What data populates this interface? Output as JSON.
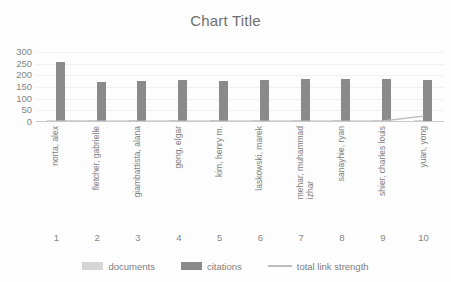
{
  "chart_data": {
    "type": "bar",
    "title": "Chart Title",
    "xlabel": "",
    "ylabel": "",
    "ylim": [
      0,
      300
    ],
    "yticks": [
      300,
      250,
      200,
      150,
      100,
      50,
      0
    ],
    "grid": true,
    "legend_position": "bottom",
    "categories": [
      "norta, alex",
      "fletcher, gabrielle",
      "giambattista, alana",
      "gong, elgar",
      "kim, henry m.",
      "laskowski, marek",
      "mehar, muhammad\nizhar",
      "sanayhie, ryan",
      "shier, charles louis",
      "yuan, yong"
    ],
    "index_labels": [
      "1",
      "2",
      "3",
      "4",
      "5",
      "6",
      "7",
      "8",
      "9",
      "10"
    ],
    "series": [
      {
        "name": "documents",
        "type": "bar",
        "color": "#d5d5d5",
        "values": [
          3,
          2,
          2,
          2,
          2,
          2,
          2,
          2,
          2,
          3
        ]
      },
      {
        "name": "citations",
        "type": "bar",
        "color": "#8a8a8a",
        "values": [
          255,
          168,
          172,
          175,
          173,
          176,
          178,
          178,
          180,
          176
        ]
      },
      {
        "name": "total link strength",
        "type": "line",
        "color": "#bcbcbc",
        "values": [
          4,
          3,
          3,
          3,
          3,
          3,
          3,
          3,
          4,
          25
        ]
      }
    ]
  },
  "colors": {
    "documents": "#d5d5d5",
    "citations": "#8a8a8a",
    "total_link_strength": "#bcbcbc",
    "axis": "#c9c9c9",
    "gridline": "#f0f0f0",
    "text": "#7d7d7d",
    "background": "#fdfdfd"
  }
}
